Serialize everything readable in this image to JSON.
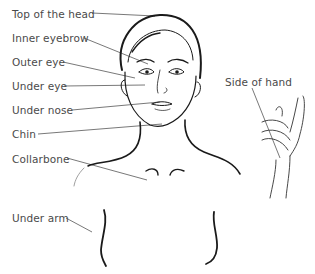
{
  "diagram": {
    "type": "tapping-points-illustration",
    "labels": [
      {
        "id": "top-of-head",
        "text": "Top of the head",
        "x": 12,
        "y": 8
      },
      {
        "id": "inner-eyebrow",
        "text": "Inner eyebrow",
        "x": 12,
        "y": 32
      },
      {
        "id": "outer-eye",
        "text": "Outer eye",
        "x": 12,
        "y": 56
      },
      {
        "id": "under-eye",
        "text": "Under eye",
        "x": 12,
        "y": 80
      },
      {
        "id": "under-nose",
        "text": "Under nose",
        "x": 12,
        "y": 104
      },
      {
        "id": "chin",
        "text": "Chin",
        "x": 12,
        "y": 128
      },
      {
        "id": "collarbone",
        "text": "Collarbone",
        "x": 12,
        "y": 153
      },
      {
        "id": "under-arm",
        "text": "Under arm",
        "x": 12,
        "y": 212
      },
      {
        "id": "side-of-hand",
        "text": "Side of hand",
        "x": 225,
        "y": 76
      }
    ],
    "colors": {
      "text": "#4a4a4a",
      "leader_line": "#555555",
      "drawing": "#1a1a1a"
    }
  }
}
